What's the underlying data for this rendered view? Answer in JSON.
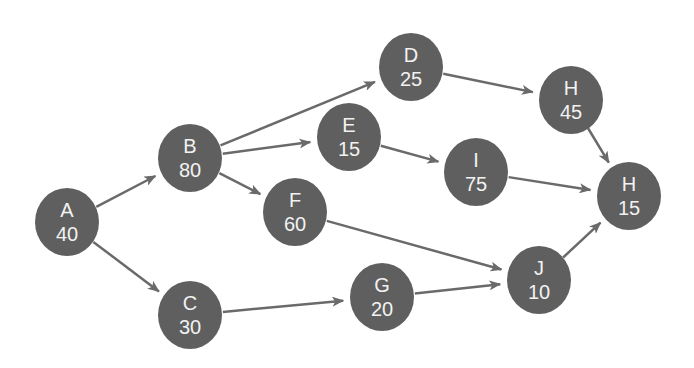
{
  "diagram": {
    "type": "activity-on-node network",
    "colors": {
      "node_fill": "#5f5f5f",
      "node_text": "#f2f2f2",
      "edge": "#6a6a6a",
      "background": "#ffffff"
    },
    "nodes": [
      {
        "id": "A",
        "label": "A",
        "value": "40",
        "x": 67,
        "y": 222
      },
      {
        "id": "B",
        "label": "B",
        "value": "80",
        "x": 190,
        "y": 158
      },
      {
        "id": "C",
        "label": "C",
        "value": "30",
        "x": 190,
        "y": 315
      },
      {
        "id": "D",
        "label": "D",
        "value": "25",
        "x": 411,
        "y": 67
      },
      {
        "id": "E",
        "label": "E",
        "value": "15",
        "x": 349,
        "y": 137
      },
      {
        "id": "F",
        "label": "F",
        "value": "60",
        "x": 295,
        "y": 212
      },
      {
        "id": "G",
        "label": "G",
        "value": "20",
        "x": 382,
        "y": 297
      },
      {
        "id": "H1",
        "label": "H",
        "value": "45",
        "x": 571,
        "y": 100
      },
      {
        "id": "I",
        "label": "I",
        "value": "75",
        "x": 476,
        "y": 172
      },
      {
        "id": "H2",
        "label": "H",
        "value": "15",
        "x": 629,
        "y": 196
      },
      {
        "id": "J",
        "label": "J",
        "value": "10",
        "x": 539,
        "y": 280
      }
    ],
    "edges": [
      {
        "from": "A",
        "to": "B"
      },
      {
        "from": "A",
        "to": "C"
      },
      {
        "from": "B",
        "to": "D"
      },
      {
        "from": "B",
        "to": "E"
      },
      {
        "from": "B",
        "to": "F"
      },
      {
        "from": "D",
        "to": "H1"
      },
      {
        "from": "E",
        "to": "I"
      },
      {
        "from": "F",
        "to": "J"
      },
      {
        "from": "C",
        "to": "G"
      },
      {
        "from": "G",
        "to": "J"
      },
      {
        "from": "H1",
        "to": "H2"
      },
      {
        "from": "I",
        "to": "H2"
      },
      {
        "from": "J",
        "to": "H2"
      }
    ]
  }
}
